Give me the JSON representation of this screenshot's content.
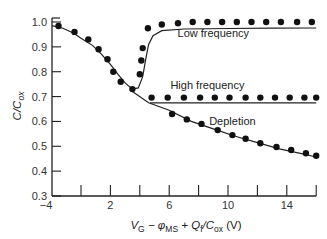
{
  "chart_data": {
    "type": "scatter",
    "title": "",
    "xlabel": {
      "main": "V",
      "sub1": "G",
      "mid": " − φ",
      "sub2": "MS",
      "mid2": " + Q",
      "sub3": "f",
      "mid3": "/C",
      "sub4": "ox",
      "end": " (V)"
    },
    "ylabel": {
      "main": "C/C",
      "sub": "ox"
    },
    "xlim": [
      -4,
      16
    ],
    "ylim": [
      0.3,
      1.0
    ],
    "x_ticks": [
      -4,
      0,
      2,
      4,
      6,
      8,
      10,
      12,
      14,
      16
    ],
    "x_tick_labels": [
      {
        "value": -4,
        "label": "−4"
      },
      {
        "value": 2,
        "label": "2"
      },
      {
        "value": 6,
        "label": "6"
      },
      {
        "value": 10,
        "label": "10"
      },
      {
        "value": 14,
        "label": "14"
      }
    ],
    "y_ticks": [
      1.0,
      0.9,
      0.8,
      0.7,
      0.6,
      0.5,
      0.4,
      0.3
    ],
    "y_tick_labels": [
      "1.0",
      "0.9",
      "0.8",
      "0.7",
      "0.6",
      "0.5",
      "0.4",
      "0.3"
    ],
    "grid": false,
    "annotations": [
      {
        "text": "Low frequency",
        "x": 9.0,
        "y": 0.94
      },
      {
        "text": "High frequency",
        "x": 8.6,
        "y": 0.73
      },
      {
        "text": "Depletion",
        "x": 10.3,
        "y": 0.585
      }
    ],
    "series": [
      {
        "name": "Low frequency (theory)",
        "kind": "line",
        "points": [
          [
            -4,
            0.985
          ],
          [
            -2.5,
            0.975
          ],
          [
            -1,
            0.955
          ],
          [
            0,
            0.935
          ],
          [
            0.8,
            0.905
          ],
          [
            1.4,
            0.87
          ],
          [
            2,
            0.83
          ],
          [
            2.5,
            0.79
          ],
          [
            3,
            0.755
          ],
          [
            3.5,
            0.73
          ],
          [
            3.9,
            0.735
          ],
          [
            4.2,
            0.78
          ],
          [
            4.4,
            0.85
          ],
          [
            4.6,
            0.91
          ],
          [
            4.9,
            0.945
          ],
          [
            5.5,
            0.965
          ],
          [
            7,
            0.972
          ],
          [
            10,
            0.974
          ],
          [
            13,
            0.975
          ],
          [
            16,
            0.976
          ]
        ]
      },
      {
        "name": "High frequency (theory)",
        "kind": "line",
        "points": [
          [
            4.7,
            0.675
          ],
          [
            16,
            0.675
          ]
        ]
      },
      {
        "name": "Depletion (theory)",
        "kind": "line",
        "points": [
          [
            3.5,
            0.72
          ],
          [
            4.6,
            0.675
          ],
          [
            6,
            0.645
          ],
          [
            7.5,
            0.6
          ],
          [
            9,
            0.57
          ],
          [
            10.5,
            0.54
          ],
          [
            12,
            0.515
          ],
          [
            13.5,
            0.49
          ],
          [
            15,
            0.47
          ],
          [
            16,
            0.457
          ]
        ]
      },
      {
        "name": "Low frequency (measured)",
        "kind": "dots",
        "points": [
          [
            -3.1,
            0.984
          ],
          [
            -0.9,
            0.96
          ],
          [
            0.5,
            0.93
          ],
          [
            1.2,
            0.89
          ],
          [
            1.8,
            0.85
          ],
          [
            2.2,
            0.8
          ],
          [
            2.7,
            0.76
          ],
          [
            3.5,
            0.73
          ],
          [
            4.0,
            0.79
          ],
          [
            4.1,
            0.845
          ],
          [
            4.2,
            0.895
          ],
          [
            4.55,
            0.975
          ],
          [
            5.5,
            0.99
          ],
          [
            6.6,
            0.995
          ],
          [
            7.6,
            1.0
          ],
          [
            8.6,
            1.0
          ],
          [
            9.6,
            1.0
          ],
          [
            10.6,
            1.0
          ],
          [
            11.6,
            1.0
          ],
          [
            12.6,
            1.0
          ],
          [
            13.6,
            1.0
          ],
          [
            14.7,
            1.0
          ],
          [
            15.7,
            1.0
          ]
        ]
      },
      {
        "name": "High frequency (measured)",
        "kind": "dots",
        "points": [
          [
            4.8,
            0.696
          ],
          [
            5.9,
            0.696
          ],
          [
            7.0,
            0.696
          ],
          [
            8.1,
            0.696
          ],
          [
            9.1,
            0.696
          ],
          [
            10.1,
            0.696
          ],
          [
            11.2,
            0.696
          ],
          [
            12.2,
            0.696
          ],
          [
            13.2,
            0.696
          ],
          [
            14.2,
            0.696
          ],
          [
            15.2,
            0.696
          ],
          [
            16.0,
            0.696
          ]
        ]
      },
      {
        "name": "Depletion (measured)",
        "kind": "dots",
        "points": [
          [
            6.2,
            0.63
          ],
          [
            7.2,
            0.608
          ],
          [
            8.2,
            0.59
          ],
          [
            9.3,
            0.565
          ],
          [
            10.3,
            0.545
          ],
          [
            11.2,
            0.53
          ],
          [
            12.2,
            0.512
          ],
          [
            13.3,
            0.497
          ],
          [
            14.3,
            0.485
          ],
          [
            15.3,
            0.472
          ],
          [
            16.0,
            0.462
          ]
        ]
      }
    ]
  }
}
